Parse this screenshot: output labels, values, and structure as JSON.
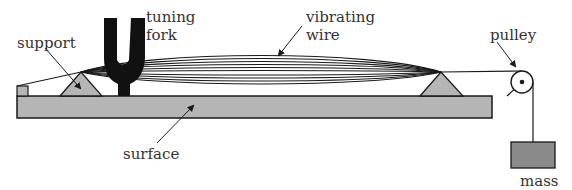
{
  "diagram": {
    "labels": {
      "tuning_fork_line1": "tuning",
      "tuning_fork_line2": "fork",
      "vibrating_wire_line1": "vibrating",
      "vibrating_wire_line2": "wire",
      "support": "support",
      "pulley": "pulley",
      "surface": "surface",
      "mass": "mass"
    },
    "colors": {
      "fill_gray": "#b5b5b5",
      "mass_fill": "#8a8a8a",
      "stroke": "#1a1a1a",
      "text": "#333333"
    }
  }
}
